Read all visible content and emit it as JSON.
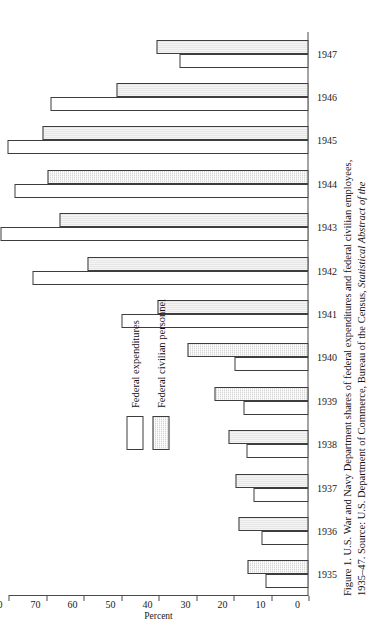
{
  "figure": {
    "caption_line1": "Figure 1. U.S. War and Navy Department shares of federal expenditures and federal civilian employees,",
    "caption_line2_a": "1935–47. Source: U.S. Department of Commerce, Bureau of the Census, ",
    "caption_line2_italic": "Statistical Abstract of the"
  },
  "legend": {
    "items": [
      {
        "label": "Federal expenditures",
        "swatch": "white-open-square",
        "color": "#ffffff"
      },
      {
        "label": "Federal civilian personnel",
        "swatch": "gray-hatched-square",
        "color": "#d6d6d6"
      }
    ]
  },
  "axis": {
    "value_title": "Percent",
    "value_ticks": [
      "0",
      "10",
      "20",
      "30",
      "40",
      "50",
      "60",
      "70",
      "80"
    ],
    "category_ticks": [
      "1935",
      "1936",
      "1937",
      "1938",
      "1939",
      "1940",
      "1941",
      "1942",
      "1943",
      "1944",
      "1945",
      "1946",
      "1947"
    ]
  },
  "chart_data": {
    "type": "bar",
    "xlabel": "",
    "ylabel": "Percent",
    "ylim": [
      0,
      80
    ],
    "grid": false,
    "orientation": "vertical-grouped",
    "legend_position": "upper-left",
    "categories": [
      "1935",
      "1936",
      "1937",
      "1938",
      "1939",
      "1940",
      "1941",
      "1942",
      "1943",
      "1944",
      "1945",
      "1946",
      "1947"
    ],
    "series": [
      {
        "name": "Federal expenditures",
        "color": "#ffffff",
        "values": [
          11.4,
          12.6,
          14.6,
          16.6,
          17.3,
          19.8,
          50.0,
          73.5,
          82.2,
          78.5,
          80.2,
          68.8,
          34.5
        ]
      },
      {
        "name": "Federal civilian personnel",
        "color": "#d6d6d6",
        "values": [
          16.2,
          18.8,
          19.6,
          21.4,
          25.0,
          32.2,
          40.3,
          59.0,
          66.5,
          69.5,
          71.0,
          51.3,
          40.6
        ]
      }
    ]
  }
}
